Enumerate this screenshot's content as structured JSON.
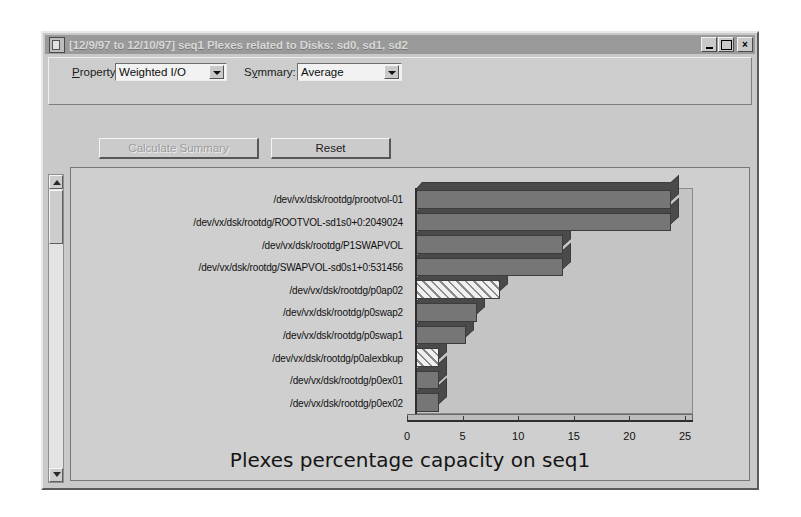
{
  "window": {
    "title": "[12/9/97 to 12/10/97] seq1 Plexes related to Disks: sd0, sd1, sd2",
    "icon": "document-icon",
    "buttons": {
      "minimize": "minimize-icon",
      "maximize": "maximize-icon",
      "close": "×"
    }
  },
  "controls": {
    "property_label_pre": "P",
    "property_label_post": "roperty:",
    "property_value": "Weighted I/O",
    "property_arrow": "chevron-down-icon",
    "summary_label_pre": "S",
    "summary_label_mid": "y",
    "summary_label_post": "mmary:",
    "summary_value": "Average",
    "summary_arrow": "chevron-down-icon"
  },
  "buttons": {
    "calculate": "Calculate Summary",
    "reset": "Reset"
  },
  "scrollbar": {
    "up": "scroll-up-arrow-icon",
    "down": "scroll-down-arrow-icon",
    "thumb": "scrollbar-thumb"
  },
  "chart_data": {
    "type": "bar",
    "orientation": "horizontal",
    "title": "Plexes percentage capacity on seq1",
    "xlabel": "",
    "ylabel": "",
    "xlim": [
      0,
      25
    ],
    "xticks": [
      0,
      5,
      10,
      15,
      20,
      25
    ],
    "grid": false,
    "legend": "none",
    "categories": [
      "/dev/vx/dsk/rootdg/prootvol-01",
      "/dev/vx/dsk/rootdg/ROOTVOL-sd1s0+0:2049024",
      "/dev/vx/dsk/rootdg/P1SWAPVOL",
      "/dev/vx/dsk/rootdg/SWAPVOL-sd0s1+0:531456",
      "/dev/vx/dsk/rootdg/p0ap02",
      "/dev/vx/dsk/rootdg/p0swap2",
      "/dev/vx/dsk/rootdg/p0swap1",
      "/dev/vx/dsk/rootdg/p0alexbkup",
      "/dev/vx/dsk/rootdg/p0ex01",
      "/dev/vx/dsk/rootdg/p0ex02"
    ],
    "values": [
      23.0,
      23.0,
      13.3,
      13.3,
      7.6,
      5.6,
      4.6,
      2.2,
      2.2,
      2.2
    ],
    "bar_fills": [
      "solid",
      "solid",
      "solid",
      "solid",
      "hatched",
      "solid",
      "solid",
      "hatched",
      "solid",
      "solid"
    ],
    "colors": {
      "bar": "#767676",
      "bar_hatch_bg": "#f0f0f0",
      "bar_side": "#4a4a4a",
      "floor": "#bdbdbd",
      "back": "#c4c4c4",
      "axis": "#2e2e2e"
    }
  }
}
